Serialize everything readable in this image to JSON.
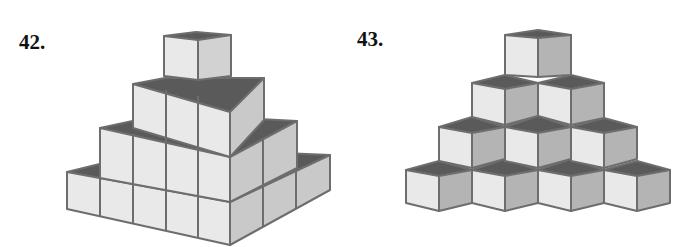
{
  "figures": [
    {
      "label": "42.",
      "description": "Stepped pyramid of cubes: four tiers, widths 4,3,2,1 cubes seen in isometric view (front-left and front-right faces)",
      "tiers": [
        {
          "level": 1,
          "front_left_cubes": 4,
          "front_right_cubes": 4
        },
        {
          "level": 2,
          "front_left_cubes": 3,
          "front_right_cubes": 3
        },
        {
          "level": 3,
          "front_left_cubes": 2,
          "front_right_cubes": 2
        },
        {
          "level": 4,
          "front_left_cubes": 1,
          "front_right_cubes": 1
        }
      ]
    },
    {
      "label": "43.",
      "description": "Triangular stack of isometric cubes: rows of 4, 3, 2, 1 cubes from bottom to top",
      "rows": [
        4,
        3,
        2,
        1
      ]
    }
  ],
  "colors": {
    "top_face": "#5a5a5a",
    "light_face": "#e9e9e9",
    "mid_face": "#c9c9c9",
    "dark_side_face": "#b4b4b4",
    "edge": "#6d6d6d",
    "text": "#111111"
  }
}
